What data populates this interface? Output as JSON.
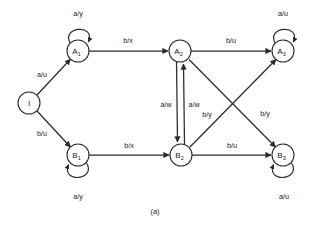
{
  "figure": {
    "caption": "(a)",
    "type": "finite-state-machine-diagram",
    "colors": {
      "background": "#ffffff",
      "stroke": "#2b2b2b",
      "text": "#1a1a1a",
      "node_fill": "#ffffff"
    }
  },
  "nodes": [
    {
      "id": "I",
      "base": "I",
      "sub": "",
      "x": 29,
      "y": 103,
      "r": 11
    },
    {
      "id": "A1",
      "base": "A",
      "sub": "1",
      "x": 78,
      "y": 51,
      "r": 11
    },
    {
      "id": "A2",
      "base": "A",
      "sub": "2",
      "x": 180,
      "y": 51,
      "r": 11
    },
    {
      "id": "A3",
      "base": "A",
      "sub": "3",
      "x": 283,
      "y": 51,
      "r": 11
    },
    {
      "id": "B1",
      "base": "B",
      "sub": "1",
      "x": 78,
      "y": 155,
      "r": 11
    },
    {
      "id": "B2",
      "base": "B",
      "sub": "2",
      "x": 181,
      "y": 155,
      "r": 11
    },
    {
      "id": "B3",
      "base": "B",
      "sub": "3",
      "x": 283,
      "y": 155,
      "r": 11
    }
  ],
  "edges": [
    {
      "from": "I",
      "to": "A1",
      "label": "a/u",
      "lx": 42,
      "ly": 74,
      "kind": "diagonal"
    },
    {
      "from": "I",
      "to": "B1",
      "label": "b/u",
      "lx": 42,
      "ly": 133,
      "kind": "diagonal"
    },
    {
      "from": "A1",
      "to": "A2",
      "label": "b/x",
      "lx": 128,
      "ly": 40,
      "kind": "straight"
    },
    {
      "from": "B1",
      "to": "B2",
      "label": "b/x",
      "lx": 129,
      "ly": 145,
      "kind": "straight"
    },
    {
      "from": "A2",
      "to": "A3",
      "label": "b/u",
      "lx": 231,
      "ly": 40,
      "kind": "straight"
    },
    {
      "from": "B2",
      "to": "B3",
      "label": "b/u",
      "lx": 232,
      "ly": 145,
      "kind": "straight"
    },
    {
      "from": "A2",
      "to": "B2",
      "label": "a/w",
      "lx": 166,
      "ly": 104,
      "kind": "vertical-left"
    },
    {
      "from": "B2",
      "to": "A2",
      "label": "a/w",
      "lx": 194,
      "ly": 104,
      "kind": "vertical-right"
    },
    {
      "from": "A2",
      "to": "B3",
      "label": "b/y",
      "lx": 265,
      "ly": 113,
      "kind": "cross"
    },
    {
      "from": "B2",
      "to": "A3",
      "label": "b/y",
      "lx": 207,
      "ly": 114,
      "kind": "cross"
    }
  ],
  "self_loops": [
    {
      "node": "A1",
      "label": "a/y",
      "position": "top",
      "lx": 78,
      "ly": 13
    },
    {
      "node": "A3",
      "label": "a/u",
      "position": "top",
      "lx": 283,
      "ly": 13
    },
    {
      "node": "B1",
      "label": "a/y",
      "position": "bottom",
      "lx": 78,
      "ly": 196
    },
    {
      "node": "B3",
      "label": "a/u",
      "position": "bottom",
      "lx": 284,
      "ly": 196
    }
  ]
}
